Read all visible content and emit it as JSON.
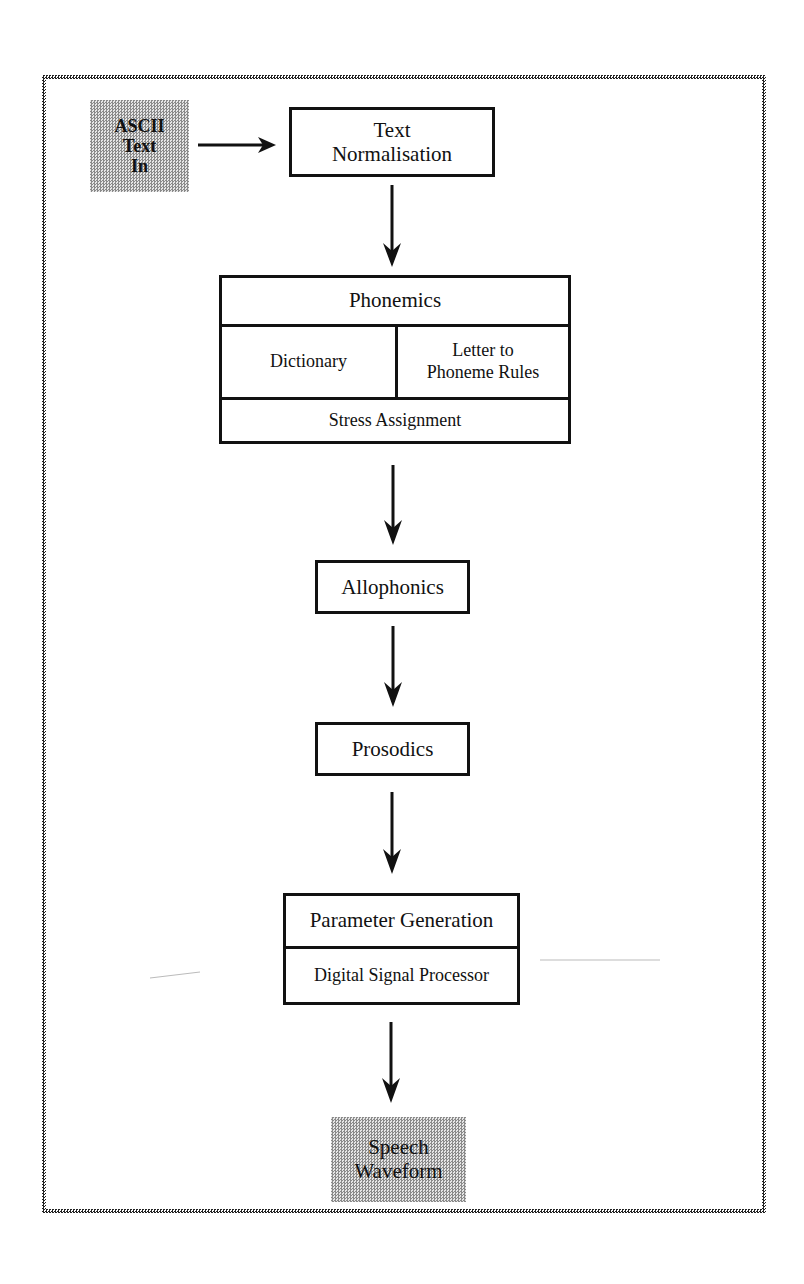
{
  "diagram": {
    "type": "flowchart",
    "input": {
      "lines": [
        "ASCII",
        "Text",
        "In"
      ]
    },
    "text_normalisation": {
      "lines": [
        "Text",
        "Normalisation"
      ]
    },
    "phonemics": {
      "header": "Phonemics",
      "dictionary": "Dictionary",
      "letter_to_phoneme": [
        "Letter to",
        "Phoneme Rules"
      ],
      "stress": "Stress Assignment"
    },
    "allophonics": "Allophonics",
    "prosodics": "Prosodics",
    "parameter_block": {
      "parameter_generation": "Parameter Generation",
      "dsp": "Digital Signal Processor"
    },
    "output": {
      "lines": [
        "Speech",
        "Waveform"
      ]
    },
    "edges": [
      {
        "from": "ASCII Text In",
        "to": "Text Normalisation"
      },
      {
        "from": "Text Normalisation",
        "to": "Phonemics"
      },
      {
        "from": "Phonemics",
        "to": "Allophonics"
      },
      {
        "from": "Allophonics",
        "to": "Prosodics"
      },
      {
        "from": "Prosodics",
        "to": "Parameter Generation"
      },
      {
        "from": "Digital Signal Processor",
        "to": "Speech Waveform"
      }
    ],
    "colors": {
      "line": "#111111",
      "shade_dark": "#8a8a8a",
      "shade_light": "#e6e6e6",
      "background": "#ffffff"
    }
  }
}
